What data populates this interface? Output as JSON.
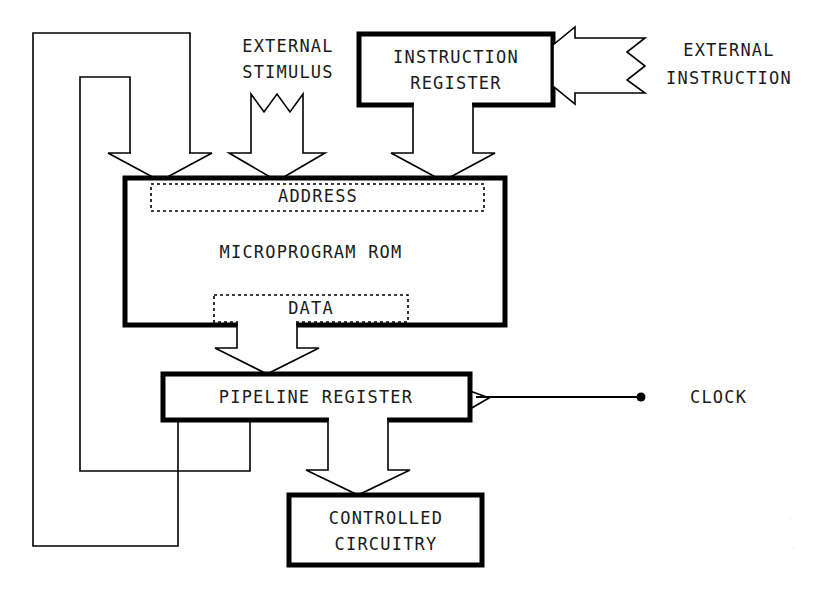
{
  "diagram": {
    "background_color": "#ffffff",
    "line_color": "#000000",
    "blocks": [
      {
        "id": "instruction_register",
        "label_line1": "INSTRUCTION",
        "label_line2": "REGISTER"
      },
      {
        "id": "microprogram_rom",
        "label": "MICROPROGRAM ROM"
      },
      {
        "id": "address_field",
        "label": "ADDRESS"
      },
      {
        "id": "data_field",
        "label": "DATA"
      },
      {
        "id": "pipeline_register",
        "label": "PIPELINE REGISTER"
      },
      {
        "id": "controlled_circuitry",
        "label_line1": "CONTROLLED",
        "label_line2": "CIRCUITRY"
      }
    ],
    "signals": [
      {
        "id": "external_stimulus",
        "label_line1": "EXTERNAL",
        "label_line2": "STIMULUS"
      },
      {
        "id": "external_instruction",
        "label_line1": "EXTERNAL",
        "label_line2": "INSTRUCTION"
      },
      {
        "id": "clock",
        "label": "CLOCK"
      }
    ]
  }
}
